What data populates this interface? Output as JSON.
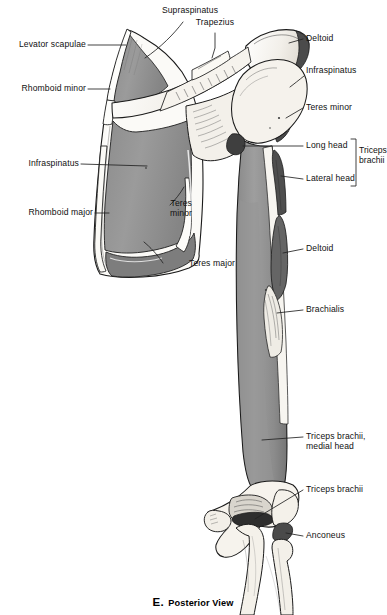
{
  "figure": {
    "caption_letter": "E.",
    "caption_text": "Posterior View",
    "view": "Posterior View"
  },
  "labels": {
    "supraspinatus": "Supraspinatus",
    "trapezius": "Trapezius",
    "levator_scapulae": "Levator scapulae",
    "rhomboid_minor": "Rhomboid minor",
    "infraspinatus_left": "Infraspinatus",
    "rhomboid_major": "Rhomboid major",
    "teres_minor_mid_line1": "Teres",
    "teres_minor_mid_line2": "minor",
    "teres_major": "Teres major",
    "deltoid_top": "Deltoid",
    "infraspinatus_right": "Infraspinatus",
    "teres_minor_right": "Teres minor",
    "long_head": "Long head",
    "lateral_head": "Lateral head",
    "triceps_brachii_group_line1": "Triceps",
    "triceps_brachii_group_line2": "brachii",
    "deltoid_lower": "Deltoid",
    "brachialis": "Brachialis",
    "triceps_medial_head_line1": "Triceps brachii,",
    "triceps_medial_head_line2": "medial head",
    "triceps_brachii_elbow": "Triceps brachii",
    "anconeus": "Anconeus"
  },
  "colors": {
    "outline": "#1a1a1a",
    "bone_light": "#f4f2ee",
    "bone_shadow": "#d9d5ce",
    "muscle_mid_gray": "#8e8e8e",
    "muscle_gray": "#9a9a9a",
    "muscle_dark_gray": "#6e6e6e",
    "muscle_darkest": "#3c3c3c",
    "leader_line": "#222222",
    "background": "#ffffff"
  }
}
